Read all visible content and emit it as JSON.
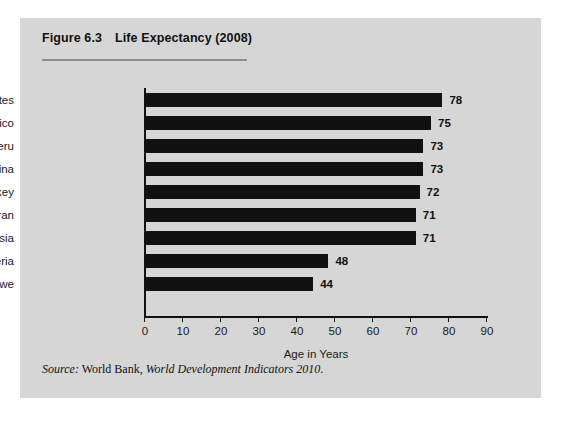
{
  "figure": {
    "number_label": "Figure 6.3",
    "title": "Life Expectancy (2008)",
    "source_lead": "Source:",
    "source_org": " World Bank, ",
    "source_publication": "World Development Indicators 2010",
    "source_end": "."
  },
  "colors": {
    "panel_background": "#d6d6d6",
    "page_background": "#ffffff",
    "bar_color": "#111111",
    "axis_color": "#111111",
    "rule_color": "#8e8e8e",
    "text_color": "#1a1a1a"
  },
  "chart_data": {
    "type": "bar",
    "orientation": "horizontal",
    "title": "Life Expectancy (2008)",
    "xlabel": "Age in Years",
    "ylabel": "",
    "xlim": [
      0,
      90
    ],
    "xticks": [
      0,
      10,
      20,
      30,
      40,
      50,
      60,
      70,
      80,
      90
    ],
    "xtick_labels": [
      "0",
      "10",
      "20",
      "30",
      "40",
      "50",
      "60",
      "70",
      "80",
      "90"
    ],
    "grid": false,
    "legend": false,
    "data_labels": true,
    "categories": [
      "United States",
      "Mexico",
      "Peru",
      "China",
      "Turkey",
      "Iran",
      "Indonesia",
      "Nigeria",
      "Zimbabwe"
    ],
    "values": [
      78,
      75,
      73,
      73,
      72,
      71,
      71,
      48,
      44
    ],
    "value_labels": [
      "78",
      "75",
      "73",
      "73",
      "72",
      "71",
      "71",
      "48",
      "44"
    ]
  }
}
